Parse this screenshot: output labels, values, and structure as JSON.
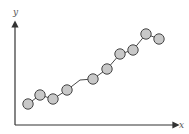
{
  "chart_data": {
    "type": "line",
    "title": "",
    "xlabel": "x",
    "ylabel": "y",
    "grid": false,
    "legend": null,
    "marker": "circle",
    "x": [
      1,
      2,
      3,
      4,
      5,
      6,
      7,
      8,
      9,
      10
    ],
    "series": [
      {
        "name": "data",
        "values": [
          2.1,
          3.0,
          2.6,
          3.5,
          4.6,
          5.6,
          7.1,
          7.5,
          9.1,
          8.6
        ],
        "line_points_extra": [
          {
            "x": 4.5,
            "y": 4.5
          }
        ]
      }
    ],
    "xlim": [
      0,
      11.5
    ],
    "ylim": [
      0,
      10
    ],
    "colors": {
      "axis": "#333333",
      "line": "#333333",
      "marker_fill": "#c8c8c8",
      "marker_stroke": "#444444"
    }
  },
  "pixel_points": [
    [
      28,
      104
    ],
    [
      40,
      95
    ],
    [
      53,
      99
    ],
    [
      67,
      90
    ],
    [
      93,
      79
    ],
    [
      107,
      69
    ],
    [
      120,
      54
    ],
    [
      133,
      50
    ],
    [
      146,
      34
    ],
    [
      159,
      39
    ]
  ],
  "line_path": [
    [
      28,
      104
    ],
    [
      40,
      95
    ],
    [
      53,
      99
    ],
    [
      67,
      90
    ],
    [
      80,
      80
    ],
    [
      93,
      79
    ],
    [
      107,
      69
    ],
    [
      120,
      54
    ],
    [
      133,
      50
    ],
    [
      146,
      34
    ],
    [
      159,
      39
    ]
  ],
  "labels": {
    "x": "x",
    "y": "y"
  }
}
